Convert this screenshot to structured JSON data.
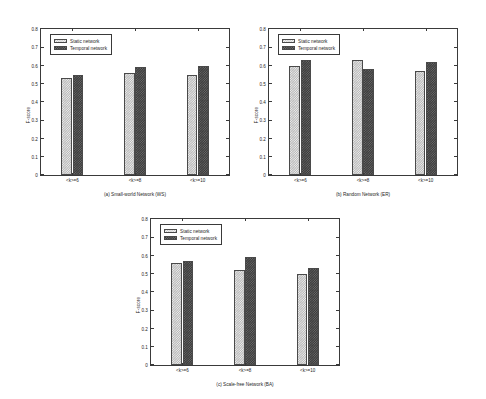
{
  "figure": {
    "background_color": "#ffffff",
    "static_color": "#b9b9b9",
    "temporal_color": "#3c3c3c",
    "axis_color": "#3a3a3a"
  },
  "legend": {
    "static_label": "Static network",
    "temporal_label": "Temporal network",
    "static_swatch_icon": "hatched-light-square-icon",
    "temporal_swatch_icon": "hatched-dark-square-icon"
  },
  "axis": {
    "ylabel": "F-score",
    "yticks": [
      "0",
      "0.1",
      "0.2",
      "0.3",
      "0.4",
      "0.5",
      "0.6",
      "0.7",
      "0.8"
    ],
    "ylim": [
      0,
      0.8
    ],
    "xticks": [
      "<k>=6",
      "<k>=8",
      "<k>=10"
    ]
  },
  "chart_data": [
    {
      "type": "bar",
      "panel": "a",
      "title": "(a) Small-world  Network (WS)",
      "xlabel": "",
      "ylabel": "F-score",
      "ylim": [
        0,
        0.8
      ],
      "yticks": [
        0,
        0.1,
        0.2,
        0.3,
        0.4,
        0.5,
        0.6,
        0.7,
        0.8
      ],
      "grid": false,
      "legend_position": "upper-left",
      "categories": [
        "<k>=6",
        "<k>=8",
        "<k>=10"
      ],
      "series": [
        {
          "name": "Static network",
          "values": [
            0.53,
            0.56,
            0.55
          ]
        },
        {
          "name": "Temporal network",
          "values": [
            0.55,
            0.59,
            0.6
          ]
        }
      ]
    },
    {
      "type": "bar",
      "panel": "b",
      "title": "(b) Random  Network (ER)",
      "xlabel": "",
      "ylabel": "F-score",
      "ylim": [
        0,
        0.8
      ],
      "yticks": [
        0,
        0.1,
        0.2,
        0.3,
        0.4,
        0.5,
        0.6,
        0.7,
        0.8
      ],
      "grid": false,
      "legend_position": "upper-left",
      "categories": [
        "<k>=6",
        "<k>=8",
        "<k>=10"
      ],
      "series": [
        {
          "name": "Static network",
          "values": [
            0.6,
            0.63,
            0.57
          ]
        },
        {
          "name": "Temporal network",
          "values": [
            0.63,
            0.58,
            0.62
          ]
        }
      ]
    },
    {
      "type": "bar",
      "panel": "c",
      "title": "(c) Scale-free Network (BA)",
      "xlabel": "",
      "ylabel": "F-score",
      "ylim": [
        0,
        0.8
      ],
      "yticks": [
        0,
        0.1,
        0.2,
        0.3,
        0.4,
        0.5,
        0.6,
        0.7,
        0.8
      ],
      "grid": false,
      "legend_position": "upper-left",
      "categories": [
        "<k>=6",
        "<k>=8",
        "<k>=10"
      ],
      "series": [
        {
          "name": "Static network",
          "values": [
            0.56,
            0.52,
            0.5
          ]
        },
        {
          "name": "Temporal network",
          "values": [
            0.57,
            0.59,
            0.53
          ]
        }
      ]
    }
  ]
}
